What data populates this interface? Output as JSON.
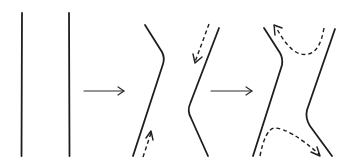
{
  "diagram": {
    "title": "",
    "colors": {
      "line": "#1e1e1e",
      "background": "#ffffff"
    },
    "stages": [
      {
        "id": "stage-1",
        "label": "",
        "elements": [
          "two parallel vertical lines"
        ]
      },
      {
        "id": "stage-2",
        "label": "",
        "elements": [
          "kinked left line",
          "kinked right line",
          "dashed arrow downward (top right)",
          "dashed arrow upward (bottom left)"
        ]
      },
      {
        "id": "stage-3",
        "label": "",
        "elements": [
          "pinched left line",
          "pinched right line",
          "dashed arrow curving to upper-left",
          "dashed arrow curving to lower-right"
        ]
      }
    ],
    "transitions": [
      {
        "from": "stage-1",
        "to": "stage-2",
        "icon": "right-arrow-icon"
      },
      {
        "from": "stage-2",
        "to": "stage-3",
        "icon": "right-arrow-icon"
      }
    ]
  }
}
